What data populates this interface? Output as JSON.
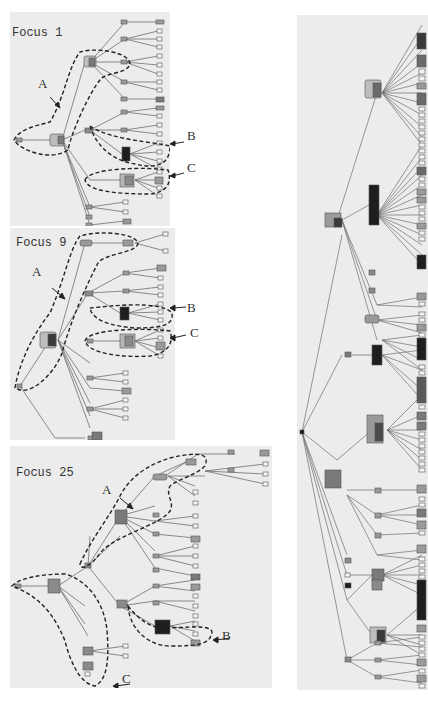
{
  "figure": {
    "panels": [
      {
        "id": "focus-1",
        "label": "Focus 1",
        "callouts": [
          "A",
          "B",
          "C"
        ]
      },
      {
        "id": "focus-9",
        "label": "Focus 9",
        "callouts": [
          "A",
          "B",
          "C"
        ]
      },
      {
        "id": "focus-25",
        "label": "Focus 25",
        "callouts": [
          "A",
          "B",
          "C"
        ]
      },
      {
        "id": "full-tree",
        "label": ""
      }
    ],
    "colors": {
      "panel_bg": "#ececec",
      "edge": "#6f6f6f",
      "node_fill": "#9a9a9a",
      "node_light": "#bdbdbd",
      "node_dark": "#1e1e1e",
      "leaf_fill": "#f4f4f4",
      "dash": "#222222"
    }
  }
}
